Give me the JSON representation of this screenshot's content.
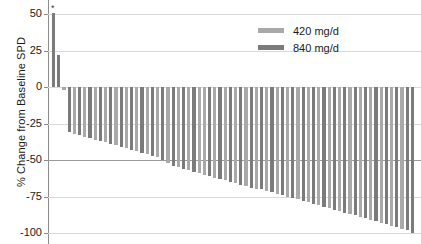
{
  "chart_data": {
    "type": "bar",
    "title": "",
    "subtitle": "",
    "xlabel": "",
    "ylabel": "% Change from Baseline SPD",
    "ylim": [
      -100,
      50
    ],
    "yticks": [
      50,
      25,
      0,
      -25,
      -50,
      -75,
      -100
    ],
    "ytick_labels": [
      "50",
      "25",
      "0",
      "-25",
      "-50",
      "-75",
      "-100"
    ],
    "grid": true,
    "reference_line": -50,
    "legend_position": "top-right",
    "legend": [
      {
        "name": "420 mg/d",
        "color": "#a9a9a9"
      },
      {
        "name": "840 mg/d",
        "color": "#7b7b7b"
      }
    ],
    "series": [
      {
        "name": "420 mg/d",
        "color": "#a9a9a9"
      },
      {
        "name": "840 mg/d",
        "color": "#7b7b7b"
      }
    ],
    "annotations": [
      {
        "text": "*",
        "bar_index": 0,
        "value": 51
      }
    ],
    "categories": [
      "1",
      "2",
      "3",
      "4",
      "5",
      "6",
      "7",
      "8",
      "9",
      "10",
      "11",
      "12",
      "13",
      "14",
      "15",
      "16",
      "17",
      "18",
      "19",
      "20",
      "21",
      "22",
      "23",
      "24",
      "25",
      "26",
      "27",
      "28",
      "29",
      "30",
      "31",
      "32",
      "33",
      "34",
      "35",
      "36",
      "37",
      "38",
      "39",
      "40",
      "41",
      "42",
      "43",
      "44",
      "45",
      "46",
      "47",
      "48",
      "49",
      "50",
      "51",
      "52",
      "53",
      "54",
      "55",
      "56",
      "57",
      "58",
      "59",
      "60",
      "61",
      "62",
      "63",
      "64",
      "65",
      "66",
      "67",
      "68",
      "69",
      "70"
    ],
    "values": [
      51,
      22,
      -2,
      -31,
      -32,
      -33,
      -34,
      -35,
      -36,
      -37,
      -38,
      -39,
      -40,
      -41,
      -42,
      -43,
      -44,
      -45,
      -46,
      -47,
      -48,
      -50,
      -52,
      -54,
      -55,
      -56,
      -57,
      -58,
      -59,
      -60,
      -61,
      -62,
      -63,
      -64,
      -65,
      -66,
      -67,
      -68,
      -69,
      -70,
      -70,
      -71,
      -72,
      -73,
      -74,
      -75,
      -76,
      -77,
      -78,
      -79,
      -80,
      -81,
      -82,
      -83,
      -84,
      -85,
      -86,
      -87,
      -88,
      -89,
      -90,
      -91,
      -92,
      -93,
      -94,
      -95,
      -96,
      -97,
      -98,
      -100
    ],
    "bar_groups": [
      "840",
      "840",
      "420",
      "840",
      "420",
      "840",
      "420",
      "840",
      "420",
      "840",
      "420",
      "840",
      "420",
      "840",
      "420",
      "840",
      "420",
      "840",
      "420",
      "840",
      "420",
      "840",
      "420",
      "840",
      "420",
      "840",
      "420",
      "840",
      "420",
      "420",
      "840",
      "420",
      "840",
      "420",
      "840",
      "420",
      "840",
      "420",
      "840",
      "420",
      "840",
      "420",
      "840",
      "420",
      "840",
      "420",
      "840",
      "420",
      "840",
      "420",
      "840",
      "420",
      "840",
      "420",
      "840",
      "420",
      "840",
      "420",
      "840",
      "420",
      "840",
      "420",
      "840",
      "420",
      "840",
      "420",
      "840",
      "420",
      "840",
      "840"
    ]
  },
  "legend": {
    "items": [
      {
        "label": "420 mg/d",
        "color": "#a9a9a9"
      },
      {
        "label": "840 mg/d",
        "color": "#7b7b7b"
      }
    ]
  },
  "axis": {
    "y_title": "% Change from Baseline SPD",
    "y_tick_labels": [
      "50",
      "25",
      "0",
      "-25",
      "-50",
      "-75",
      "-100"
    ]
  },
  "annotation": {
    "asterisk": "*"
  }
}
